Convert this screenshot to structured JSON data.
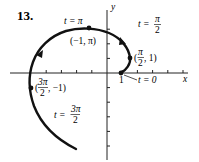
{
  "problem_number": "13.",
  "axes": {
    "x_label": "x",
    "y_label": "y",
    "x_tick_label": "1"
  },
  "points": [
    {
      "id": "t0",
      "param_label": "t = 0",
      "coord_label": ""
    },
    {
      "id": "t_half_pi",
      "param_label": "t = π/2",
      "coord_label": "(π/2, 1)",
      "frac_num": "π",
      "frac_den": "2",
      "coord_prefix": "(",
      "coord_suffix": ", 1)"
    },
    {
      "id": "t_pi",
      "param_label": "t = π",
      "coord_label": "(−1, π)"
    },
    {
      "id": "t_3half_pi",
      "param_label": "t = 3π/2",
      "coord_label": "(3π/2, −1)",
      "frac_num": "3π",
      "frac_den": "2",
      "coord_prefix": "(",
      "coord_suffix": ", −1)"
    }
  ],
  "labels": {
    "t_eq": "t =",
    "pi": "π",
    "two": "2",
    "three_pi": "3π",
    "t_pi": "t = π",
    "t_zero": "t = 0",
    "coord_pi": "(−1, π)",
    "open": "(",
    "close_1": ", 1)",
    "close_m1": ", −1)"
  }
}
